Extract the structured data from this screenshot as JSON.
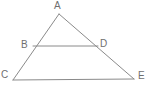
{
  "figure": {
    "kind": "triangle-with-parallel-segment",
    "background_color": "#ffffff",
    "stroke_color": "#8a8a8a",
    "label_color": "#6f6f6f",
    "stroke_width": 1,
    "canvas": {
      "width": 150,
      "height": 93
    },
    "points": {
      "A": {
        "label": "A",
        "x": 59,
        "y": 14
      },
      "B": {
        "label": "B",
        "x": 33,
        "y": 46
      },
      "D": {
        "label": "D",
        "x": 98,
        "y": 46
      },
      "C": {
        "label": "C",
        "x": 13,
        "y": 80
      },
      "E": {
        "label": "E",
        "x": 134,
        "y": 79
      }
    },
    "segments": [
      {
        "name": "AC",
        "from": "A",
        "to": "C",
        "path": "M 59 14 L 13 80"
      },
      {
        "name": "AE",
        "from": "A",
        "to": "E",
        "path": "M 59 14 L 134 79"
      },
      {
        "name": "CE",
        "from": "C",
        "to": "E",
        "path": "M 13 80 L 134 79"
      },
      {
        "name": "BD",
        "from": "B",
        "to": "D",
        "path": "M 33 46 L 98 46"
      }
    ]
  }
}
